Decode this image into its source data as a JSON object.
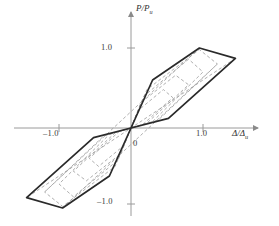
{
  "figure": {
    "name": "hysteresis-loop-diagram",
    "background": "#ffffff",
    "line_color": "#2a2a2a",
    "dashed_color": "#8c8c8c",
    "axis_color": "#9a9a9a"
  },
  "axes": {
    "y_title_main": "P/P",
    "y_title_sub": "u",
    "x_title_main": "Δ/Δ",
    "x_title_sub": "u",
    "origin_label": "0",
    "y_ticks": [
      {
        "value": 1.0,
        "label": "1.0"
      },
      {
        "value": -1.0,
        "label": "–1.0"
      }
    ],
    "x_ticks": [
      {
        "value": 1.0,
        "label": "1.0"
      },
      {
        "value": -1.0,
        "label": "–1.0"
      }
    ]
  },
  "chart_data": {
    "type": "line",
    "title": "",
    "xlabel": "Δ/Δu",
    "ylabel": "P/Pu",
    "xlim": [
      -1.9,
      1.9
    ],
    "ylim": [
      -1.45,
      1.45
    ],
    "grid": false,
    "legend": "none",
    "series": [
      {
        "name": "outer-envelope-loop",
        "style": "solid-thick",
        "color": "#2a2a2a",
        "closed": true,
        "x": [
          0.0,
          0.3,
          0.95,
          1.45,
          0.52,
          0.0,
          -0.3,
          -0.95,
          -1.45,
          -0.52
        ],
        "y": [
          0.0,
          0.6,
          1.0,
          0.87,
          0.12,
          0.0,
          -0.6,
          -1.0,
          -0.87,
          -0.12
        ]
      },
      {
        "name": "inner-loop-1",
        "style": "dashed",
        "color": "#8c8c8c",
        "closed": true,
        "x": [
          0.0,
          0.22,
          0.95,
          1.2,
          0.38,
          0.0,
          -0.22,
          -0.95,
          -1.2,
          -0.38
        ],
        "y": [
          0.0,
          0.48,
          0.98,
          0.8,
          0.1,
          0.0,
          -0.48,
          -0.98,
          -0.8,
          -0.1
        ]
      },
      {
        "name": "inner-loop-2",
        "style": "dashed",
        "color": "#8c8c8c",
        "closed": true,
        "x": [
          0.0,
          0.18,
          0.8,
          1.0,
          0.3,
          0.0,
          -0.18,
          -0.8,
          -1.0,
          -0.3
        ],
        "y": [
          0.0,
          0.4,
          0.86,
          0.7,
          0.08,
          0.0,
          -0.4,
          -0.86,
          -0.7,
          -0.08
        ]
      },
      {
        "name": "inner-loop-3",
        "style": "dashed",
        "color": "#8c8c8c",
        "closed": true,
        "x": [
          0.0,
          0.14,
          0.62,
          0.8,
          0.22,
          0.0,
          -0.14,
          -0.62,
          -0.8,
          -0.22
        ],
        "y": [
          0.0,
          0.32,
          0.66,
          0.54,
          0.06,
          0.0,
          -0.32,
          -0.66,
          -0.54,
          -0.06
        ]
      },
      {
        "name": "inner-loop-4",
        "style": "dashed",
        "color": "#8c8c8c",
        "closed": true,
        "x": [
          0.0,
          0.1,
          0.45,
          0.58,
          0.16,
          0.0,
          -0.1,
          -0.45,
          -0.58,
          -0.16
        ],
        "y": [
          0.0,
          0.22,
          0.48,
          0.38,
          0.04,
          0.0,
          -0.22,
          -0.48,
          -0.38,
          -0.04
        ]
      },
      {
        "name": "unload-chord-a",
        "style": "dashed",
        "color": "#8c8c8c",
        "closed": false,
        "x": [
          1.45,
          -1.45
        ],
        "y": [
          0.87,
          -0.87
        ]
      },
      {
        "name": "unload-chord-b",
        "style": "dashed",
        "color": "#8c8c8c",
        "closed": false,
        "x": [
          0.95,
          -1.2
        ],
        "y": [
          1.0,
          -0.8
        ]
      },
      {
        "name": "unload-chord-c",
        "style": "dashed",
        "color": "#8c8c8c",
        "closed": false,
        "x": [
          -0.95,
          1.2
        ],
        "y": [
          -1.0,
          0.8
        ]
      }
    ]
  }
}
